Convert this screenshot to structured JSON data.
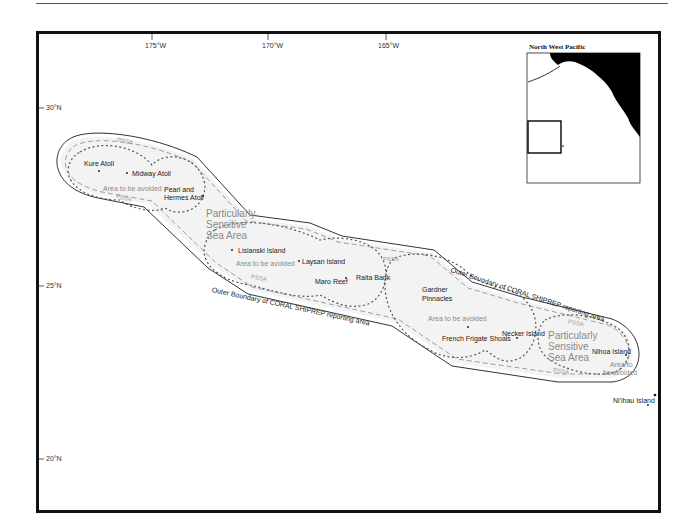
{
  "map": {
    "title": "Particularly Sensitive Sea Area - Northwestern Hawaiian Islands",
    "longitude_ticks": [
      "175°W",
      "170°W",
      "165°W"
    ],
    "latitude_ticks": [
      "30°N",
      "25°N",
      "20°N"
    ],
    "inset": {
      "title": "North West Pacific"
    },
    "islands": [
      "Kure Atoll",
      "Midway Atoll",
      "Pearl and",
      "Hermes Atoll",
      "Lisianski Island",
      "Laysan Island",
      "Maro Reef",
      "Raita Bank",
      "Gardner",
      "Pinnacles",
      "French Frigate Shoals",
      "Necker Island",
      "Nihoa Island",
      "Ni'ihau Island"
    ],
    "areas_to_avoid": [
      "Area to be avoided",
      "Area to be avoided",
      "Area to be avoided",
      "Area to",
      "be avoided"
    ],
    "pssa_labels": {
      "big_1": [
        "Particularly",
        "Sensitive",
        "Sea Area"
      ],
      "big_2": [
        "Particularly",
        "Sensitive",
        "Sea Area"
      ],
      "small": "PSSA"
    },
    "boundary_labels": [
      "Outer Boundary of CORAL SHIPREP reporting area",
      "Outer Boundary of CORAL SHIPREP reporting area"
    ],
    "colors": {
      "frame": "#111111",
      "boundary": "#333333",
      "pssa_dashed": "#888888",
      "atba_dotted": "#555555",
      "land": "#000000",
      "pssa_text": "#8a8a8a"
    }
  }
}
